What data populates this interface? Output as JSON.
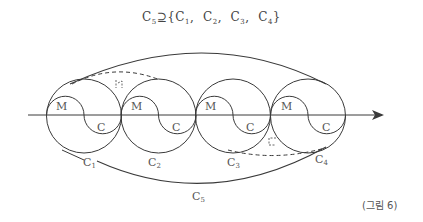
{
  "title": {
    "main": "C",
    "main_sub": "5",
    "relation": "⊇",
    "set": [
      {
        "letter": "C",
        "sub": "1"
      },
      {
        "letter": "C",
        "sub": "2"
      },
      {
        "letter": "C",
        "sub": "3"
      },
      {
        "letter": "C",
        "sub": "4"
      }
    ]
  },
  "circles": [
    {
      "id": "C1",
      "cx": 84,
      "label_top": "M",
      "label_bottom": "C",
      "name_letter": "C",
      "name_sub": "1"
    },
    {
      "id": "C2",
      "cx": 158.5,
      "label_top": "M",
      "label_bottom": "C",
      "name_letter": "C",
      "name_sub": "2"
    },
    {
      "id": "C3",
      "cx": 233,
      "label_top": "M",
      "label_bottom": "C",
      "name_letter": "C",
      "name_sub": "3"
    },
    {
      "id": "C4",
      "cx": 308,
      "label_top": "M",
      "label_bottom": "C",
      "name_letter": "C",
      "name_sub": "4"
    }
  ],
  "outer": {
    "name_letter": "C",
    "name_sub": "5"
  },
  "marks": {
    "top_dashed": "ㄴ",
    "bottom_dashed": "ㄷ"
  },
  "caption": "(그림 6)",
  "colors": {
    "stroke": "#3a3a3a",
    "text": "#555555"
  }
}
